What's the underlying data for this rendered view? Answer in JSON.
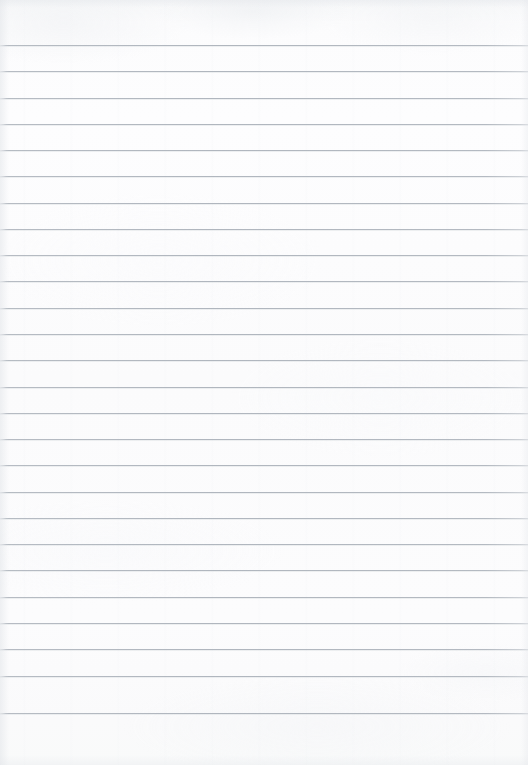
{
  "document": {
    "kind": "lined-notebook-page",
    "title": "Blank ruled notebook page",
    "content_text": "",
    "page_width": 528,
    "page_height": 765,
    "background_color": "#fbfbfc",
    "paper_tone": "off-white"
  },
  "ruling": {
    "style": "horizontal-ruled",
    "line_color": "#b0b6be",
    "line_thickness_px": 1,
    "line_count": 26,
    "first_line_y": 45,
    "line_spacing_px": 26.3,
    "last_line_y": 713,
    "left_inset_px": 0,
    "right_inset_px": 0,
    "has_vertical_margin_rule": false,
    "top_margin_px": 45,
    "bottom_margin_px": 52,
    "line_positions_y": [
      45,
      71,
      98,
      124,
      150,
      176,
      203,
      229,
      255,
      281,
      308,
      334,
      360,
      387,
      413,
      439,
      465,
      492,
      518,
      544,
      570,
      597,
      623,
      649,
      676,
      713
    ]
  },
  "annotations": {
    "handwriting": [],
    "marks": [],
    "page_number": "",
    "header_text": "",
    "footer_text": ""
  }
}
